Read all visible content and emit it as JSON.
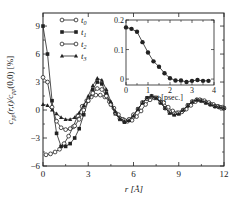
{
  "chart_data": [
    {
      "type": "line",
      "xlabel": "r [Å]",
      "ylabel": "c_pp(r,t)/c_pp(0,0) [%]",
      "xlim": [
        0,
        12
      ],
      "ylim": [
        -6,
        10.4
      ],
      "xticks": [
        "0",
        "3",
        "6",
        "9",
        "12"
      ],
      "yticks": [
        "-6",
        "-3",
        "0",
        "3",
        "6",
        "9"
      ],
      "legend_position": "upper left",
      "series": [
        {
          "name": "t0",
          "marker": "open-circle",
          "x": [
            0.2,
            0.5,
            0.8,
            1.1,
            1.4,
            1.7,
            2.0,
            2.3,
            2.6,
            2.9,
            3.2,
            3.5,
            3.8,
            4.1,
            4.4,
            4.7,
            5.0,
            5.3,
            5.6,
            5.9,
            6.2,
            6.5,
            6.8,
            7.1,
            7.4,
            7.7,
            8.0,
            8.3,
            8.6,
            8.9,
            9.2,
            9.5,
            9.8,
            10.1,
            10.4,
            10.7,
            11.0,
            11.3,
            11.6,
            11.9
          ],
          "y": [
            -4.8,
            -4.7,
            -4.5,
            -4.2,
            -3.6,
            -2.8,
            -1.8,
            -0.6,
            0.4,
            1.0,
            1.4,
            1.6,
            1.6,
            1.4,
            0.9,
            0.2,
            -0.5,
            -1.0,
            -1.2,
            -1.1,
            -0.7,
            -0.1,
            0.6,
            1.1,
            1.3,
            1.2,
            0.8,
            0.3,
            -0.1,
            -0.3,
            -0.2,
            0.1,
            0.5,
            0.9,
            1.1,
            1.0,
            0.8,
            0.6,
            0.4,
            0.3
          ]
        },
        {
          "name": "t1",
          "marker": "filled-square",
          "x": [
            0.0,
            0.3,
            0.6,
            0.9,
            1.2,
            1.5,
            1.8,
            2.1,
            2.4,
            2.7,
            3.0,
            3.3,
            3.6,
            3.9,
            4.2,
            4.5,
            4.8,
            5.1,
            5.4,
            5.7,
            6.0,
            6.3,
            6.6,
            6.9,
            7.2,
            7.5,
            7.8,
            8.1,
            8.4,
            8.7,
            9.0,
            9.3,
            9.6,
            9.9,
            10.2,
            10.5,
            10.8,
            11.1,
            11.4,
            11.7,
            12.0
          ],
          "y": [
            9.0,
            6.0,
            1.0,
            -2.5,
            -3.9,
            -3.9,
            -3.6,
            -3.0,
            -2.0,
            -0.5,
            1.0,
            2.2,
            3.0,
            2.8,
            1.8,
            0.6,
            -0.4,
            -1.0,
            -1.3,
            -1.1,
            -0.6,
            0.1,
            0.8,
            1.3,
            1.5,
            1.3,
            0.8,
            0.2,
            -0.3,
            -0.5,
            -0.4,
            0.0,
            0.5,
            0.9,
            1.1,
            1.0,
            0.8,
            0.6,
            0.4,
            0.3,
            0.2
          ]
        },
        {
          "name": "t2",
          "marker": "open-circle",
          "x": [
            0.0,
            0.3,
            0.6,
            0.9,
            1.2,
            1.5,
            1.8,
            2.1,
            2.4,
            2.7,
            3.0,
            3.3,
            3.6,
            3.9,
            4.2,
            4.5,
            4.8,
            5.1,
            5.4,
            5.7,
            6.0,
            6.3,
            6.6,
            6.9,
            7.2,
            7.5,
            7.8,
            8.1,
            8.4,
            8.7,
            9.0,
            9.3,
            9.6,
            9.9,
            10.2,
            10.5,
            10.8,
            11.1,
            11.4,
            11.7,
            12.0
          ],
          "y": [
            3.5,
            3.0,
            0.3,
            -1.2,
            -1.9,
            -2.1,
            -2.0,
            -1.7,
            -1.0,
            0.0,
            1.0,
            1.8,
            2.3,
            2.2,
            1.5,
            0.6,
            -0.3,
            -0.9,
            -1.1,
            -1.0,
            -0.5,
            0.1,
            0.8,
            1.2,
            1.4,
            1.3,
            0.8,
            0.2,
            -0.2,
            -0.4,
            -0.3,
            0.0,
            0.5,
            0.9,
            1.1,
            1.0,
            0.8,
            0.6,
            0.4,
            0.3,
            0.2
          ]
        },
        {
          "name": "t3",
          "marker": "filled-triangle",
          "x": [
            0.0,
            0.3,
            0.6,
            0.9,
            1.2,
            1.5,
            1.8,
            2.1,
            2.4,
            2.7,
            3.0,
            3.3,
            3.6,
            3.9,
            4.2,
            4.5,
            4.8,
            5.1,
            5.4,
            5.7,
            6.0,
            6.3,
            6.6,
            6.9,
            7.2,
            7.5,
            7.8,
            8.1,
            8.4,
            8.7,
            9.0,
            9.3,
            9.6,
            9.9,
            10.2,
            10.5,
            10.8,
            11.1,
            11.4,
            11.7,
            12.0
          ],
          "y": [
            0.6,
            0.5,
            0.0,
            -0.4,
            -0.8,
            -1.0,
            -1.0,
            -0.8,
            -0.3,
            0.5,
            1.5,
            2.6,
            3.4,
            3.2,
            2.2,
            0.9,
            -0.2,
            -0.9,
            -1.2,
            -1.1,
            -0.6,
            0.1,
            0.8,
            1.3,
            1.5,
            1.3,
            0.8,
            0.2,
            -0.3,
            -0.5,
            -0.4,
            0.0,
            0.5,
            0.9,
            1.1,
            1.0,
            0.8,
            0.6,
            0.4,
            0.3,
            0.2
          ]
        }
      ]
    },
    {
      "type": "line",
      "title": "inset",
      "xlabel": "t [psec.]",
      "ylabel": "",
      "xlim": [
        0,
        4
      ],
      "ylim": [
        -0.02,
        0.2
      ],
      "xticks": [
        "0",
        "1",
        "2",
        "3",
        "4"
      ],
      "yticks": [
        "0",
        "0.1",
        "0.2"
      ],
      "series": [
        {
          "name": "inset",
          "marker": "filled-circle",
          "x": [
            0.0,
            0.25,
            0.5,
            0.75,
            1.0,
            1.25,
            1.5,
            1.75,
            2.0,
            2.25,
            2.5,
            2.75,
            3.0,
            3.25,
            3.5,
            3.75
          ],
          "y": [
            0.175,
            0.17,
            0.16,
            0.125,
            0.09,
            0.06,
            0.042,
            0.02,
            0.003,
            -0.005,
            -0.005,
            -0.01,
            -0.006,
            -0.003,
            -0.006,
            -0.006
          ]
        }
      ]
    }
  ],
  "legend": {
    "t0": "t",
    "t0_sub": "0",
    "t1": "t",
    "t1_sub": "1",
    "t2": "t",
    "t2_sub": "2",
    "t3": "t",
    "t3_sub": "3"
  },
  "axes": {
    "xlabel_main": "r [Å]",
    "ylabel_main": "c",
    "ylabel_sub1": "pp",
    "ylabel_mid": "(r,t)/c",
    "ylabel_sub2": "pp",
    "ylabel_end": "(0,0) [%]",
    "xlabel_inset": "t [psec.]"
  }
}
